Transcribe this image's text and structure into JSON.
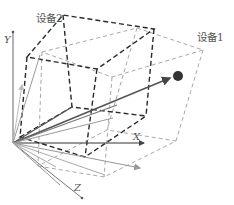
{
  "labels": {
    "device2": "设备2",
    "device1": "设备1",
    "axis_x": "X",
    "axis_y": "Y",
    "axis_z": "Z"
  },
  "colors": {
    "dark_box": "#2a2a2a",
    "light_box": "#9a9a9a",
    "axis": "#555555",
    "ray_gray": "#8f8f8f",
    "ray_light": "#b0b0b0",
    "vector_dark": "#555555",
    "point": "#333333"
  }
}
